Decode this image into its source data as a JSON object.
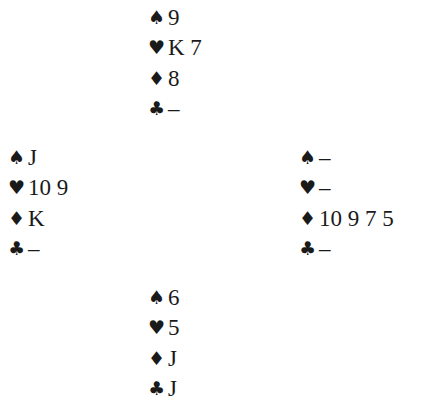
{
  "diagram": {
    "type": "bridge-hand-diagram",
    "suit_symbols": {
      "spades": "♠",
      "hearts": "♥",
      "diamonds": "♦",
      "clubs": "♣"
    },
    "hands": {
      "north": {
        "spades": "9",
        "hearts": "K 7",
        "diamonds": "8",
        "clubs": "–"
      },
      "west": {
        "spades": "J",
        "hearts": "10 9",
        "diamonds": "K",
        "clubs": "–"
      },
      "east": {
        "spades": "–",
        "hearts": "–",
        "diamonds": "10 9 7 5",
        "clubs": "–"
      },
      "south": {
        "spades": "6",
        "hearts": "5",
        "diamonds": "J",
        "clubs": "J"
      }
    }
  }
}
